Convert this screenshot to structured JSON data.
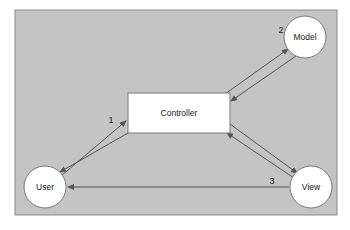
{
  "canvas": {
    "width": 350,
    "height": 230,
    "background": "#ffffff"
  },
  "frame": {
    "name": "diagram-frame",
    "x": 15,
    "y": 10,
    "width": 322,
    "height": 205,
    "fill": "#c4c4c4",
    "stroke": "#8a8a8a"
  },
  "nodes": {
    "model": {
      "label": "Model",
      "shape": "circle",
      "cx": 305,
      "cy": 37,
      "r": 21,
      "fill": "#ffffff",
      "stroke": "#7a7a7a"
    },
    "controller": {
      "label": "Controller",
      "shape": "rect",
      "x": 128,
      "y": 93,
      "width": 102,
      "height": 40,
      "fill": "#ffffff",
      "stroke": "#7a7a7a"
    },
    "user": {
      "label": "User",
      "shape": "circle",
      "cx": 45,
      "cy": 187,
      "r": 21,
      "fill": "#ffffff",
      "stroke": "#7a7a7a"
    },
    "view": {
      "label": "View",
      "shape": "circle",
      "cx": 311,
      "cy": 187,
      "r": 21,
      "fill": "#ffffff",
      "stroke": "#7a7a7a"
    }
  },
  "edges": [
    {
      "name": "edge-user-to-controller",
      "from": "User",
      "to": "Controller",
      "direction": "forward",
      "x1": 62,
      "y1": 175,
      "x2": 126,
      "y2": 121,
      "stroke": "#555555"
    },
    {
      "name": "edge-controller-to-user",
      "from": "Controller",
      "to": "User",
      "direction": "forward",
      "x1": 128,
      "y1": 133,
      "x2": 60,
      "y2": 172,
      "stroke": "#555555"
    },
    {
      "name": "edge-controller-to-model",
      "from": "Controller",
      "to": "Model",
      "direction": "forward",
      "x1": 225,
      "y1": 94,
      "x2": 288,
      "y2": 49,
      "stroke": "#555555"
    },
    {
      "name": "edge-model-to-controller",
      "from": "Model",
      "to": "Controller",
      "direction": "forward",
      "x1": 296,
      "y1": 56,
      "x2": 231,
      "y2": 101,
      "stroke": "#555555"
    },
    {
      "name": "edge-controller-to-view",
      "from": "Controller",
      "to": "View",
      "direction": "forward",
      "x1": 230,
      "y1": 124,
      "x2": 297,
      "y2": 173,
      "stroke": "#555555"
    },
    {
      "name": "edge-view-to-controller",
      "from": "View",
      "to": "Controller",
      "direction": "forward",
      "x1": 294,
      "y1": 178,
      "x2": 227,
      "y2": 133,
      "stroke": "#555555"
    },
    {
      "name": "edge-view-to-user",
      "from": "View",
      "to": "User",
      "direction": "forward",
      "x1": 289,
      "y1": 187,
      "x2": 68,
      "y2": 187,
      "stroke": "#555555"
    }
  ],
  "step_labels": [
    {
      "name": "step-label-1",
      "text": "1",
      "x": 111,
      "y": 120
    },
    {
      "name": "step-label-2",
      "text": "2",
      "x": 281,
      "y": 30
    },
    {
      "name": "step-label-3",
      "text": "3",
      "x": 272,
      "y": 181
    }
  ],
  "colors": {
    "frame_fill": "#c4c4c4",
    "frame_stroke": "#8a8a8a",
    "node_fill": "#ffffff",
    "node_stroke": "#7a7a7a",
    "arrow": "#555555",
    "text": "#1a1a1a"
  }
}
